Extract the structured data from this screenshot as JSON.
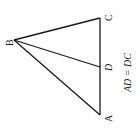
{
  "diagram": {
    "type": "triangle",
    "vertices": {
      "A": {
        "label": "A",
        "x": 100,
        "y": 115
      },
      "B": {
        "label": "B",
        "x": 14,
        "y": 40
      },
      "C": {
        "label": "C",
        "x": 100,
        "y": 18
      },
      "D": {
        "label": "D",
        "x": 100,
        "y": 67
      }
    },
    "segments": [
      "BA",
      "BC",
      "CA",
      "BD"
    ],
    "caption": "AD = DC",
    "stroke_color": "#1a1a1a"
  }
}
